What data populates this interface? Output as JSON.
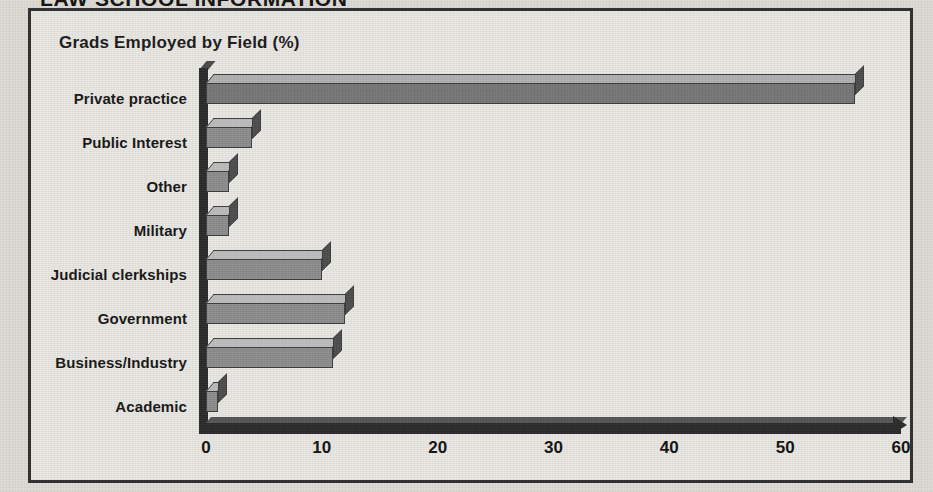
{
  "page": {
    "section_header": "LAW SCHOOL INFORMATION"
  },
  "chart": {
    "title": "Grads Employed by Field (%)"
  },
  "chart_data": {
    "type": "bar",
    "orientation": "horizontal",
    "style": "3d-bar",
    "title": "Grads Employed by Field (%)",
    "xlabel": "",
    "ylabel": "",
    "xlim": [
      0,
      60
    ],
    "xticks": [
      "0",
      "10",
      "20",
      "30",
      "40",
      "50",
      "60"
    ],
    "grid": false,
    "legend": false,
    "categories": [
      "Private practice",
      "Public Interest",
      "Other",
      "Military",
      "Judicial clerkships",
      "Government",
      "Business/Industry",
      "Academic"
    ],
    "values": [
      56,
      4,
      2,
      2,
      10,
      12,
      11,
      1
    ],
    "series": [
      {
        "name": "Grads Employed by Field (%)",
        "values": [
          56,
          4,
          2,
          2,
          10,
          12,
          11,
          1
        ]
      }
    ],
    "colors": {
      "bar_front": "#8c8c8c",
      "bar_top": "#bdbdbd",
      "bar_side": "#4d4d4d",
      "axis": "#2a2a2a",
      "frame": "#2e2e2e",
      "background": "#e9e7e2"
    }
  }
}
